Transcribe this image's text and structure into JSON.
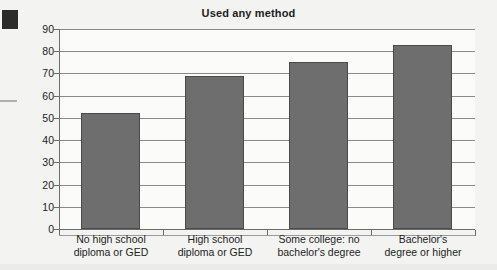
{
  "chart_data": {
    "type": "bar",
    "title": "Used any method",
    "xlabel": "",
    "ylabel": "",
    "ylim": [
      0,
      90
    ],
    "grid": true,
    "legend": "none",
    "categories": [
      "No high school diploma or GED",
      "High school diploma or GED",
      "Some college: no bachelor's degree",
      "Bachelor's degree or higher"
    ],
    "category_lines": [
      [
        "No high school",
        "diploma or GED"
      ],
      [
        "High school",
        "diploma or GED"
      ],
      [
        "Some college: no",
        "bachelor's degree"
      ],
      [
        "Bachelor's",
        "degree or higher"
      ]
    ],
    "values": [
      52,
      69,
      75,
      83
    ],
    "yticks": [
      0,
      10,
      20,
      30,
      40,
      50,
      60,
      70,
      80,
      90
    ],
    "ytick_labels": [
      "0",
      "10",
      "20",
      "30",
      "40",
      "50",
      "60",
      "70",
      "80",
      "90"
    ],
    "bar_color": "#6e6e6e",
    "bar_edge_color": "#4a4a4a",
    "gridline_color": "#8a8a8a",
    "axis_color": "#6b6b6b",
    "text_color": "#1d1d1d",
    "plot_background": "#fbfbfa",
    "page_background": "#f3f3f1"
  }
}
